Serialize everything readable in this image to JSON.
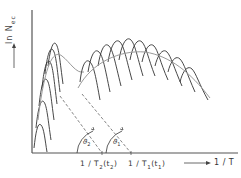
{
  "figure": {
    "y_axis": {
      "label_main": "ln N",
      "label_sub": "ec",
      "arrow": "up-arrow"
    },
    "x_axis": {
      "label": "1 / T",
      "arrow": "right-arrow"
    },
    "x_ticks": [
      {
        "label_main": "1 / T",
        "label_sub1": "2",
        "label_mid": "(t",
        "label_sub2": "2",
        "label_end": ")"
      },
      {
        "label_main": "1 / T",
        "label_sub1": "1",
        "label_mid": "(t",
        "label_sub2": "1",
        "label_end": ")"
      }
    ],
    "angles": [
      {
        "symbol": "ϑ",
        "sub": "2"
      },
      {
        "symbol": "ϑ",
        "sub": "1"
      }
    ],
    "colors": {
      "curve": "#333333",
      "envelope": "#999999",
      "axis": "#555555",
      "dashed": "#666666"
    }
  }
}
